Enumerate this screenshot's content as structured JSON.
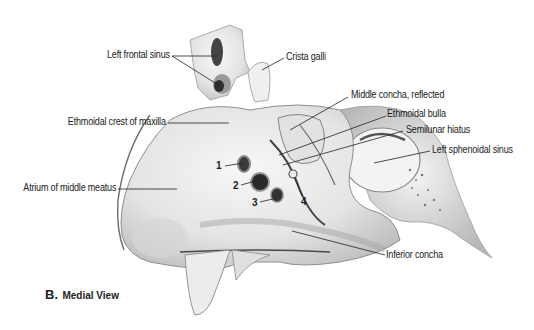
{
  "figure": {
    "caption_letter": "B.",
    "caption_text": "Medial View",
    "labels": {
      "left_frontal_sinus": "Left frontal sinus",
      "crista_galli": "Crista galli",
      "middle_concha_reflected": "Middle concha, reflected",
      "ethmoidal_crest_of_maxilla": "Ethmoidal crest of maxilla",
      "ethmoidal_bulla": "Ethmoidal bulla",
      "semilunar_hiatus": "Semilunar hiatus",
      "left_sphenoidal_sinus": "Left sphenoidal sinus",
      "atrium_of_middle_meatus": "Atrium of middle meatus",
      "inferior_concha": "Inferior concha"
    },
    "numbers": [
      "1",
      "2",
      "3",
      "4"
    ],
    "colors": {
      "bone": "#e9e9e9",
      "bone_shadow": "#bdbdbd",
      "dark_opening": "#3a3a3a",
      "leader_line": "#222222",
      "text": "#222222"
    }
  }
}
